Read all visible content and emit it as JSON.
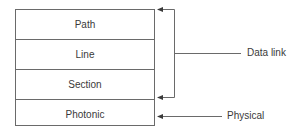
{
  "diagram": {
    "layers": [
      {
        "label": "Path"
      },
      {
        "label": "Line"
      },
      {
        "label": "Section"
      },
      {
        "label": "Photonic"
      }
    ],
    "annotations": {
      "data_link": {
        "label": "Data link",
        "spans_layers": [
          "Path",
          "Line",
          "Section"
        ]
      },
      "physical": {
        "label": "Physical",
        "spans_layers": [
          "Photonic"
        ]
      }
    },
    "colors": {
      "line": "#6a6a6a",
      "text": "#3a3a3a"
    }
  }
}
